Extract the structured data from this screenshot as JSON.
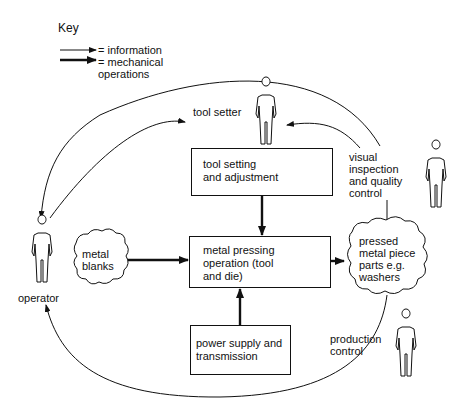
{
  "key": {
    "title": "Key",
    "items": [
      {
        "type": "thin-arrow",
        "label": "= information"
      },
      {
        "type": "thick-arrow",
        "label": "= mechanical\noperations"
      }
    ]
  },
  "people": {
    "tool_setter": "tool setter",
    "operator": "operator",
    "inspection": "visual\ninspection\nand quality\ncontrol",
    "production": "production\ncontrol"
  },
  "boxes": {
    "tool_setting": "tool setting\nand adjustment",
    "metal_pressing": "metal pressing\noperation (tool\nand die)",
    "power_supply": "power supply and\ntransmission"
  },
  "clouds": {
    "metal_blanks": "metal\nblanks",
    "pressed_parts": "pressed\nmetal piece\nparts e.g.\nwashers"
  }
}
